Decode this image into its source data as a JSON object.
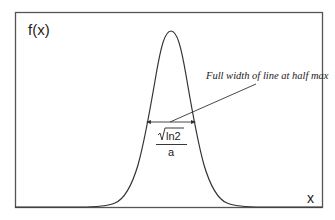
{
  "figure": {
    "y_axis_label": "f(x)",
    "x_axis_label": "x",
    "annotation": "Full width of line at half max",
    "fwhm_numerator": "ln2",
    "fwhm_denominator": "a",
    "curve": "gaussian",
    "colors": {
      "line": "#333333",
      "frame": "#555555",
      "background": "#ffffff"
    }
  }
}
